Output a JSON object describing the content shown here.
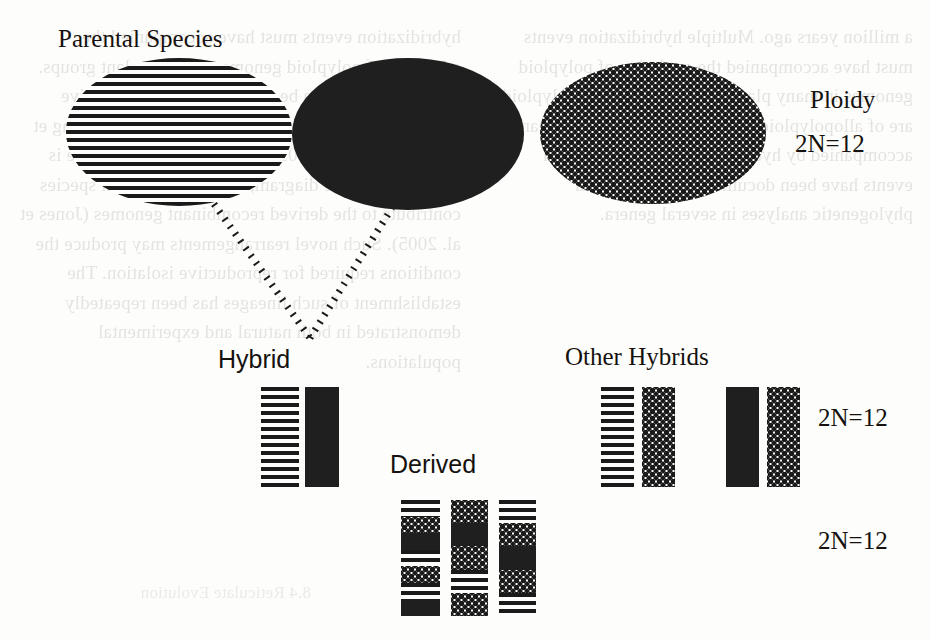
{
  "figure": {
    "title_labels": {
      "parental_species": "Parental Species",
      "hybrid": "Hybrid",
      "other_hybrids": "Other Hybrids",
      "derived": "Derived"
    },
    "ploidy_column": {
      "header": "Ploidy",
      "values": [
        "2N=12",
        "2N=12",
        "2N=12"
      ]
    },
    "parental_species": [
      {
        "name": "parent-striped",
        "pattern": "striped"
      },
      {
        "name": "parent-solid",
        "pattern": "solid"
      },
      {
        "name": "parent-dotted",
        "pattern": "dotted"
      }
    ],
    "hybrid_chromosomes": [
      {
        "name": "hybrid-chromosome-striped",
        "pattern": "striped"
      },
      {
        "name": "hybrid-chromosome-solid",
        "pattern": "solid"
      }
    ],
    "other_hybrid_chromosomes": [
      {
        "name": "other-hybrid-1-chromosome-striped",
        "pattern": "striped"
      },
      {
        "name": "other-hybrid-1-chromosome-dotted",
        "pattern": "dotted"
      },
      {
        "name": "other-hybrid-2-chromosome-solid",
        "pattern": "solid"
      },
      {
        "name": "other-hybrid-2-chromosome-dotted",
        "pattern": "dotted"
      }
    ],
    "derived_chromosomes": [
      {
        "name": "derived-chromosome-1",
        "segments": [
          "striped",
          "dotted",
          "solid",
          "striped",
          "dotted",
          "striped",
          "solid"
        ]
      },
      {
        "name": "derived-chromosome-2",
        "segments": [
          "dotted",
          "solid",
          "dotted",
          "striped",
          "dotted"
        ]
      },
      {
        "name": "derived-chromosome-3",
        "segments": [
          "striped",
          "dotted",
          "solid",
          "dotted",
          "striped"
        ]
      }
    ],
    "colors": {
      "ink": "#1a1a1a",
      "paper": "#fdfdfb",
      "ghost_text": "#3a3a3a"
    },
    "background_text": {
      "column_left": "a million years ago. Multiple hybridization events must have accompanied the evolution of polyploid genomes in many plant groups, since most polyploids are of allopolyploid origin and their formation can be accompanied by hybrid speciation events. Such events have been documented by molecular phylogenetic analyses in several genera.",
      "column_right": "hybridization events must have accompanied the evolution of polyploid genomes in many plant groups. These processes can be traced through comparative genomic studies and by chromosome painting (Yang et al. 2010; Mitchell 2009). A simple hybrid example is highlighted in the diagram, where the parental species contribute to the derived recombinant genomes (Jones et al. 2005). Such novel rearrangements may produce the conditions required for reproductive isolation. The establishment of such lineages has been repeatedly demonstrated in both natural and experimental populations.",
      "footer_ghost": "8.4 Reticulate Evolution"
    }
  }
}
